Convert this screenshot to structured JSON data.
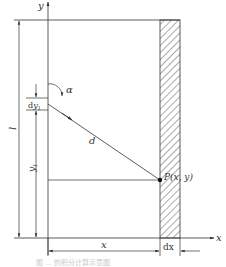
{
  "diagram": {
    "type": "geometry-schematic",
    "colors": {
      "line": "#333333",
      "hatch": "#444444",
      "caption": "#c8c8c8",
      "background": "#ffffff"
    },
    "axes": {
      "y_label": "y",
      "x_label": "x"
    },
    "labels": {
      "length": "l",
      "angle": "α",
      "distance": "d",
      "dy1_prefix": "d",
      "dy1_var": "y",
      "dy1_sub": "1",
      "y1_var": "y",
      "y1_sub": "1",
      "point": "P(x, y)",
      "x_dim": "x",
      "dx_dim": "dx"
    },
    "caption": "图 … 的积分计算示意图"
  }
}
